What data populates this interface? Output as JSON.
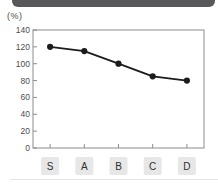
{
  "header": {
    "bar_color": "#58585a"
  },
  "colors": {
    "plot_border": "#8c8c8c",
    "line": "#1c1c1c",
    "marker": "#1c1c1c",
    "tick_text": "#4d4d4d",
    "category_box_bg": "#e7e7e7",
    "category_text": "#2e2e2e",
    "bottom_divider": "#e5e5e5"
  },
  "chart_data": {
    "type": "line",
    "title": "",
    "ylabel": "(%)",
    "xlabel": "",
    "categories": [
      "S",
      "A",
      "B",
      "C",
      "D"
    ],
    "values": [
      120,
      115,
      100,
      85,
      80
    ],
    "ylim": [
      0,
      140
    ],
    "yticks": [
      0,
      20,
      40,
      60,
      80,
      100,
      120,
      140
    ],
    "grid": false,
    "legend_position": "none",
    "marker_style": "filled-circle"
  }
}
